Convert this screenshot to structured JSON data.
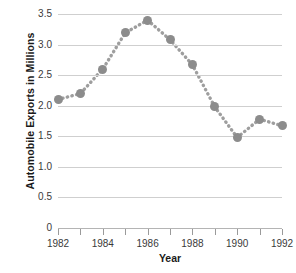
{
  "chart_data": {
    "type": "line",
    "title": "",
    "xlabel": "Year",
    "ylabel": "Automobile Exports in Millions",
    "categories": [
      1982,
      1983,
      1984,
      1985,
      1986,
      1987,
      1988,
      1989,
      1990,
      1991,
      1992
    ],
    "values": [
      2.1,
      2.2,
      2.6,
      3.19,
      3.4,
      3.08,
      2.67,
      1.98,
      1.48,
      1.78,
      1.67
    ],
    "x": [
      1982,
      1983,
      1984,
      1985,
      1986,
      1987,
      1988,
      1989,
      1990,
      1991,
      1992
    ],
    "xlim": [
      1982,
      1992
    ],
    "ylim": [
      0,
      3.5
    ],
    "y_ticks": [
      0,
      0.5,
      1.0,
      1.5,
      2.0,
      2.5,
      3.0,
      3.5
    ],
    "y_tick_labels": [
      "0",
      "0.5",
      "1.0",
      "1.5",
      "2.0",
      "2.5",
      "3.0",
      "3.5"
    ],
    "x_ticks": [
      1982,
      1983,
      1984,
      1985,
      1986,
      1987,
      1988,
      1989,
      1990,
      1991,
      1992
    ],
    "x_tick_labels": [
      "1982",
      "",
      "1984",
      "",
      "1986",
      "",
      "1988",
      "",
      "1990",
      "",
      "1992"
    ],
    "grid": "horizontal",
    "legend": "none",
    "line_style": "dotted",
    "marker": "circle",
    "colors": {
      "marker": "#8c8c8c",
      "line": "#9e9e9e",
      "gridline": "#cfcfcf",
      "axis": "#b4b4b4",
      "text": "#1b1b1b",
      "tick_text": "#3a3a3a",
      "background": "#ffffff"
    }
  }
}
